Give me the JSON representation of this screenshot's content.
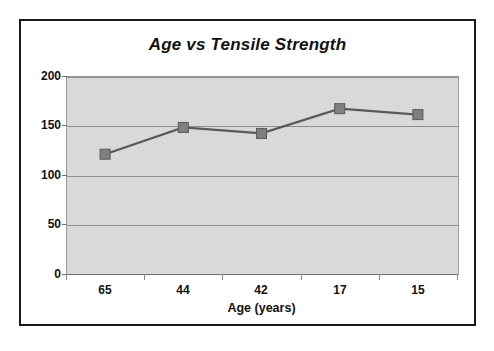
{
  "chart_data": {
    "type": "line",
    "title": "Age vs Tensile Strength",
    "xlabel": "Age (years)",
    "ylabel": "",
    "categories": [
      "65",
      "44",
      "42",
      "17",
      "15"
    ],
    "values": [
      121,
      148,
      142,
      167,
      161
    ],
    "ylim": [
      0,
      200
    ],
    "yticks": [
      0,
      50,
      100,
      150,
      200
    ],
    "ytick_labels": [
      "0",
      "50",
      "100",
      "150",
      "200"
    ],
    "grid": "horizontal",
    "legend": "none",
    "series": [
      {
        "name": "Tensile Strength",
        "values": [
          121,
          148,
          142,
          167,
          161
        ],
        "marker": "square",
        "marker_color": "#808080",
        "line_color": "#595959"
      }
    ],
    "colors": {
      "plot_background": "#d9d9d9",
      "figure_background": "#ffffff",
      "frame_border": "#1a1a1a",
      "gridline": "#8f8f8f",
      "text": "#111111"
    }
  }
}
